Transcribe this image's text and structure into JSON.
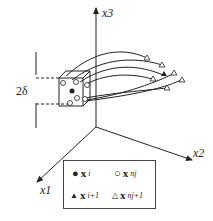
{
  "axes": {
    "x1": "x1",
    "x2": "x2",
    "x3": "x3"
  },
  "dimension_label": "2δ",
  "legend": [
    {
      "marker": "filled-circle",
      "symbol": "●",
      "var": "x",
      "sub": "i"
    },
    {
      "marker": "open-circle",
      "symbol": "○",
      "var": "x",
      "sub": "nj"
    },
    {
      "marker": "filled-triangle",
      "symbol": "▲",
      "var": "x",
      "sub": "i+1"
    },
    {
      "marker": "open-triangle",
      "symbol": "△",
      "var": "x",
      "sub": "nj+1"
    }
  ]
}
